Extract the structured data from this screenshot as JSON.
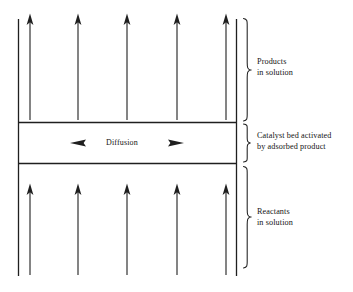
{
  "diagram": {
    "stroke_color": "#1f1f1f",
    "background_color": "#ffffff",
    "regions": [
      {
        "key": "products",
        "label_line1": "Products",
        "label_line2": "in solution",
        "flow_direction": "up",
        "arrow_count": 5
      },
      {
        "key": "catalyst",
        "label_line1": "Catalyst bed activated",
        "label_line2": "by adsorbed product",
        "flow_direction": "bidirectional-horizontal",
        "arrow_count": 2
      },
      {
        "key": "reactants",
        "label_line1": "Reactants",
        "label_line2": "in solution",
        "flow_direction": "up",
        "arrow_count": 5
      }
    ],
    "band": {
      "center_label": "Diffusion",
      "left_marker": "left-triangle-icon",
      "right_marker": "right-triangle-icon"
    },
    "braces": [
      {
        "key": "products-brace",
        "icon": "curly-brace-icon"
      },
      {
        "key": "catalyst-brace",
        "icon": "curly-brace-icon"
      },
      {
        "key": "reactants-brace",
        "icon": "curly-brace-icon"
      }
    ]
  }
}
